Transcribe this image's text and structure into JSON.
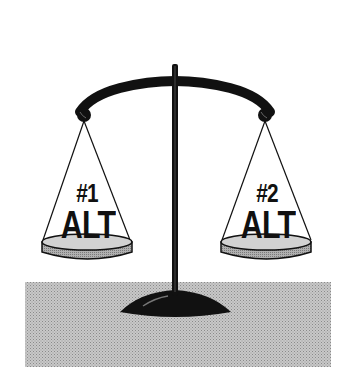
{
  "illustration": {
    "subject": "balance-scale",
    "left_pan": {
      "number": "#1",
      "word": "ALT"
    },
    "right_pan": {
      "number": "#2",
      "word": "ALT"
    }
  },
  "colors": {
    "ink": "#111111",
    "pan_fill": "#b5b5b5",
    "pan_top": "#d6d6d6",
    "ground": "#bdbdbd",
    "background": "#ffffff"
  }
}
